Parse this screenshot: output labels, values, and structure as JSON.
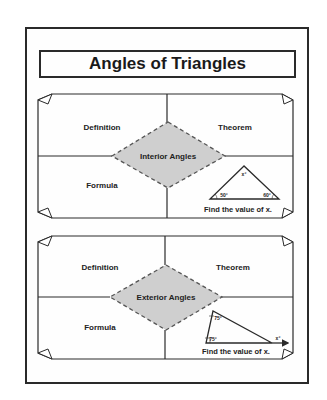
{
  "title": "Angles of Triangles",
  "colors": {
    "line": "#2a2a2a",
    "diamond_fill": "#cfcfcf",
    "diamond_stroke": "#555555",
    "background": "#ffffff"
  },
  "panels": [
    {
      "center_label": "Interior Angles",
      "quadrants": {
        "top_left": "Definition",
        "top_right": "Theorem",
        "bottom_left": "Formula",
        "bottom_right_caption": "Find the value of x."
      },
      "triangle": {
        "type": "interior",
        "angles": [
          "x°",
          "50°",
          "60°"
        ]
      }
    },
    {
      "center_label": "Exterior Angles",
      "quadrants": {
        "top_left": "Definition",
        "top_right": "Theorem",
        "bottom_left": "Formula",
        "bottom_right_caption": "Find the value of x."
      },
      "triangle": {
        "type": "exterior",
        "angles": [
          "75°",
          "75°",
          "x°"
        ]
      }
    }
  ]
}
